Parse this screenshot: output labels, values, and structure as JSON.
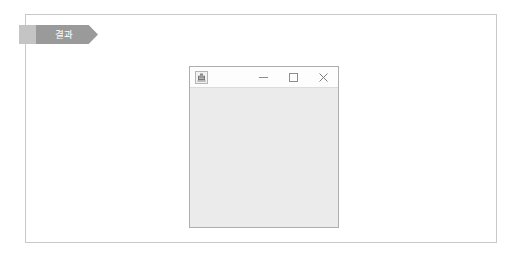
{
  "page": {
    "background_color": "#ffffff",
    "frame_border_color": "#c9c9c9"
  },
  "banner": {
    "label": "결과",
    "shape": "chevron",
    "text_color": "#ffffff",
    "fill_color": "#9a9a9a",
    "lead_fill_color": "#c4c4c4"
  },
  "window": {
    "title": "",
    "icon_name": "app-icon",
    "border_color": "#adadad",
    "titlebar_color": "#fdfdfd",
    "client_area_color": "#ebebeb",
    "client_area_content": "",
    "controls": [
      {
        "name": "minimize",
        "glyph": "minimize-icon",
        "label": "Minimize"
      },
      {
        "name": "maximize",
        "glyph": "maximize-icon",
        "label": "Maximize"
      },
      {
        "name": "close",
        "glyph": "close-icon",
        "label": "Close"
      }
    ]
  }
}
